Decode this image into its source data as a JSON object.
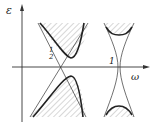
{
  "figure": {
    "axes": {
      "y_label": "ε",
      "x_label": "ω"
    },
    "annotations": {
      "half_numerator": "1",
      "half_denominator": "2",
      "one": "1"
    },
    "regions": [
      {
        "name": "upper-left shaded region",
        "shaded": true
      },
      {
        "name": "lower-left shaded region",
        "shaded": true
      },
      {
        "name": "upper-right shaded cap",
        "shaded": true
      },
      {
        "name": "lower-right shaded cap",
        "shaded": true
      }
    ],
    "colors": {
      "line": "#333333",
      "hatch": "#9a9a9a",
      "background": "#ffffff"
    }
  }
}
